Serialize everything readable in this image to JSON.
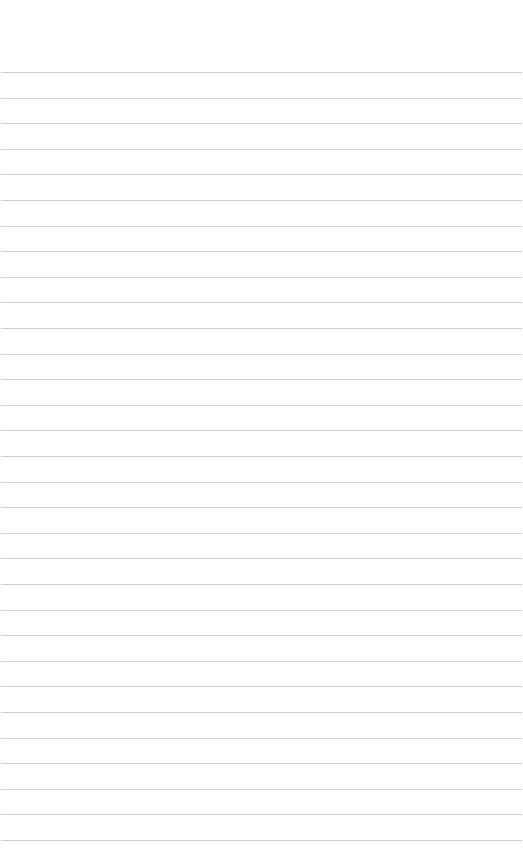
{
  "page": {
    "type": "ruled-paper",
    "background_color": "#ffffff",
    "line_color": "#cfcfcf",
    "line_count": 31,
    "first_line_y": 72,
    "line_spacing": 25.6,
    "text": ""
  }
}
